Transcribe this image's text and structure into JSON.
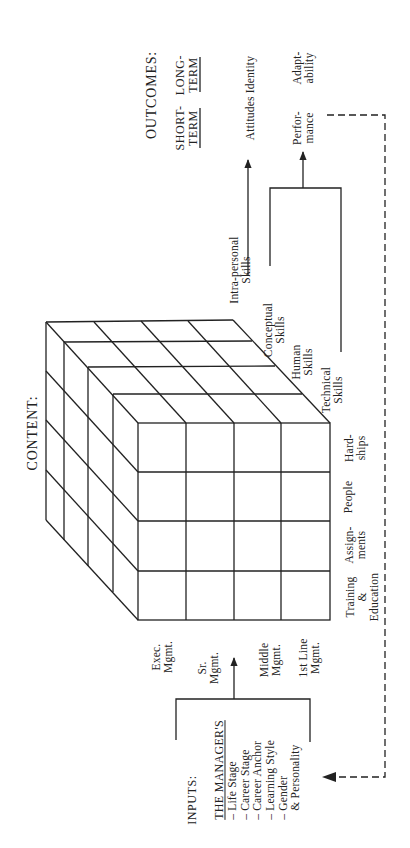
{
  "outcomes": {
    "title": "OUTCOMES:",
    "short_term": {
      "line1": "SHORT-",
      "line2": "TERM"
    },
    "long_term": {
      "line1": "LONG-",
      "line2": "TERM"
    },
    "attitudes_identity": "Attitudes Identity",
    "performance": {
      "line1": "Perfor-",
      "line2": "mance"
    },
    "adaptability": {
      "line1": "Adapt-",
      "line2": "ability"
    }
  },
  "content": {
    "title": "CONTENT:",
    "skills": [
      {
        "line1": "Intra-personal",
        "line2": "Skills"
      },
      {
        "line1": "Conceptual",
        "line2": "Skills"
      },
      {
        "line1": "Human",
        "line2": "Skills"
      },
      {
        "line1": "Technical",
        "line2": "Skills"
      }
    ],
    "methods": [
      {
        "line1": "Hard-",
        "line2": "ships"
      },
      {
        "line1": "People",
        "line2": ""
      },
      {
        "line1": "Assign-",
        "line2": "ments"
      },
      {
        "line1": "Training",
        "line2": "&",
        "line3": "Education"
      }
    ],
    "levels": [
      {
        "line1": "Exec.",
        "line2": "Mgmt."
      },
      {
        "line1": "Sr.",
        "line2": "Mgmt."
      },
      {
        "line1": "Middle",
        "line2": "Mgmt."
      },
      {
        "line1": "1st Line",
        "line2": "Mgmt."
      }
    ]
  },
  "inputs": {
    "title": "INPUTS:",
    "subtitle": "THE MANAGER'S",
    "items": [
      "– Life Stage",
      "– Career Stage",
      "– Career Anchor",
      "– Learning Style",
      "– Gender",
      "   & Personality"
    ]
  },
  "colors": {
    "ink": "#222222",
    "background": "#ffffff"
  }
}
